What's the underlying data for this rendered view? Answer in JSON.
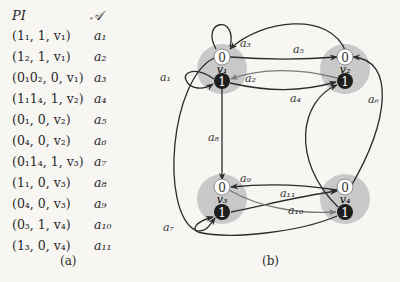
{
  "table": {
    "headers": {
      "pi": "PI",
      "action": "𝒜"
    },
    "rows": [
      {
        "pi": "(1₁, 1, v₁)",
        "action": "a₁"
      },
      {
        "pi": "(1₂, 1, v₁)",
        "action": "a₂"
      },
      {
        "pi": "(0₁0₂, 0, v₁)",
        "action": "a₃"
      },
      {
        "pi": "(1₁1₄, 1, v₂)",
        "action": "a₄"
      },
      {
        "pi": "(0₁, 0, v₂)",
        "action": "a₅"
      },
      {
        "pi": "(0₄, 0, v₂)",
        "action": "a₆"
      },
      {
        "pi": "(0₁1₄, 1, v₃)",
        "action": "a₇"
      },
      {
        "pi": "(1₁, 0, v₃)",
        "action": "a₈"
      },
      {
        "pi": "(0₄, 0, v₃)",
        "action": "a₉"
      },
      {
        "pi": "(0₃, 1, v₄)",
        "action": "a₁₀"
      },
      {
        "pi": "(1₃, 0, v₄)",
        "action": "a₁₁"
      }
    ],
    "caption": "(a)"
  },
  "graph": {
    "caption": "(b)",
    "nodes": [
      {
        "id": "v1",
        "label": "v₁",
        "top": "0",
        "bottom": "1"
      },
      {
        "id": "v2",
        "label": "v₂",
        "top": "0",
        "bottom": "1"
      },
      {
        "id": "v3",
        "label": "v₃",
        "top": "0",
        "bottom": "1"
      },
      {
        "id": "v4",
        "label": "v₄",
        "top": "0",
        "bottom": "1"
      }
    ],
    "edges": [
      {
        "label": "a₁",
        "from": "v1.1",
        "to": "v1.1"
      },
      {
        "label": "a₂",
        "from": "v2.1",
        "to": "v1.1"
      },
      {
        "label": "a₃",
        "from": "v2.0",
        "to": "v1.0"
      },
      {
        "label": "a₄",
        "from": "v4.1",
        "to": "v2.1"
      },
      {
        "label": "a₅",
        "from": "v1.0",
        "to": "v2.0"
      },
      {
        "label": "a₆",
        "from": "v4.0",
        "to": "v2.0"
      },
      {
        "label": "a₇",
        "from": "v1.0",
        "to": "v3.1"
      },
      {
        "label": "a₈",
        "from": "v1.1",
        "to": "v3.0"
      },
      {
        "label": "a₉",
        "from": "v4.0",
        "to": "v3.0"
      },
      {
        "label": "a₁₀",
        "from": "v3.0",
        "to": "v4.1"
      },
      {
        "label": "a₁₁",
        "from": "v3.1",
        "to": "v4.0"
      }
    ],
    "colors": {
      "node_halo": "#c9c9c9",
      "state_one_fill": "#1e1e1e",
      "state_zero_fill": "#ffffff",
      "edge_dark": "#2b2b2b",
      "edge_gray": "#7a7a7a"
    }
  }
}
